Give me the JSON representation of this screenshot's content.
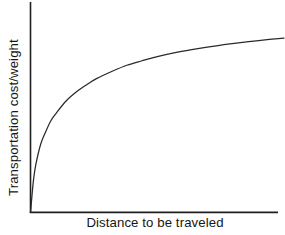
{
  "chart_data": {
    "type": "line",
    "title": "",
    "subtitle": "",
    "xlabel": "Distance to be traveled",
    "ylabel": "Transportation cost/weight",
    "legend": [],
    "legend_position": "none",
    "grid": false,
    "xticks": [],
    "yticks": [],
    "xtick_labels": [],
    "ytick_labels": [],
    "xlim": [
      0,
      1
    ],
    "ylim": [
      0,
      1
    ],
    "annotations": [],
    "series": [
      {
        "name": "Transportation cost/weight vs distance",
        "shape": "concave-increasing-saturating",
        "x": [
          0.0,
          0.01,
          0.02,
          0.04,
          0.06,
          0.08,
          0.1,
          0.14,
          0.18,
          0.22,
          0.26,
          0.32,
          0.38,
          0.44,
          0.5,
          0.58,
          0.66,
          0.74,
          0.82,
          0.9,
          1.0
        ],
        "y": [
          0.0,
          0.16,
          0.26,
          0.38,
          0.45,
          0.51,
          0.55,
          0.62,
          0.67,
          0.71,
          0.745,
          0.785,
          0.82,
          0.845,
          0.868,
          0.893,
          0.913,
          0.93,
          0.945,
          0.958,
          0.972
        ]
      }
    ]
  },
  "figure": {
    "background_color": "#ffffff",
    "axis_color": "#1f1f1f",
    "curve_color": "#2a2a2a",
    "label_color": "#161616"
  },
  "axes": {
    "x_axis_name": "x-axis-line",
    "y_axis_name": "y-axis-line"
  }
}
